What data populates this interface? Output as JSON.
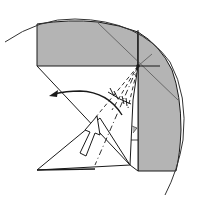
{
  "diagram": {
    "type": "origami-fold-step",
    "colors": {
      "background": "#ffffff",
      "paper_colored": "#b4b4b4",
      "paper_white": "#ffffff",
      "stroke": "#1a1a1a",
      "guide_circle": "#333333"
    },
    "elements": {
      "guide_circle": "magnified view boundary arc",
      "top_flap": "gray colored flap (top)",
      "right_flap": "gray colored flap (right)",
      "pivot_point": "reference point where folds converge",
      "valley_folds": "dashed fold lines radiating from pivot",
      "swing_arrow": "curved arrow indicating rotation to the left",
      "push_arrow": "hollow arrow indicating push / squash direction",
      "front_triangle": "white triangular layer in front"
    },
    "labels": []
  }
}
